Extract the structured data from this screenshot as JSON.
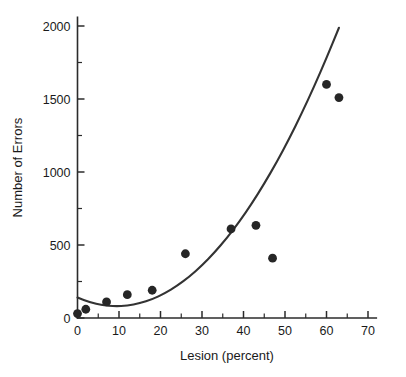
{
  "chart_data": {
    "type": "scatter",
    "title": "",
    "xlabel": "Lesion (percent)",
    "ylabel": "Number of Errors",
    "xlim": [
      0,
      72
    ],
    "ylim": [
      0,
      2060
    ],
    "grid": false,
    "legend": "none",
    "x_ticks": [
      0,
      10,
      20,
      30,
      40,
      50,
      60,
      70
    ],
    "x_tick_labels": [
      "0",
      "10",
      "20",
      "30",
      "40",
      "50",
      "60",
      "70"
    ],
    "x_minor_ticks": [
      5,
      15,
      25,
      35,
      45,
      55,
      65
    ],
    "y_ticks": [
      0,
      500,
      1000,
      1500,
      2000
    ],
    "y_tick_labels": [
      "0",
      "500",
      "1000",
      "1500",
      "2000"
    ],
    "y_minor_ticks": [
      250,
      750,
      1250,
      1750
    ],
    "marker_color": "#262626",
    "curve_color": "#333333",
    "axis_color": "#2b2b2b",
    "points": [
      {
        "x": 0,
        "y": 30
      },
      {
        "x": 2,
        "y": 60
      },
      {
        "x": 7,
        "y": 110
      },
      {
        "x": 12,
        "y": 160
      },
      {
        "x": 18,
        "y": 190
      },
      {
        "x": 26,
        "y": 440
      },
      {
        "x": 37,
        "y": 610
      },
      {
        "x": 43,
        "y": 635
      },
      {
        "x": 47,
        "y": 410
      },
      {
        "x": 60,
        "y": 1600
      },
      {
        "x": 63,
        "y": 1510
      }
    ],
    "fit": {
      "kind": "quadratic",
      "label": "fitted curve",
      "x_start": 0,
      "x_end": 69,
      "samples": [
        {
          "x": 0,
          "y": 140
        },
        {
          "x": 3,
          "y": 108
        },
        {
          "x": 6,
          "y": 88
        },
        {
          "x": 9,
          "y": 80
        },
        {
          "x": 12,
          "y": 84
        },
        {
          "x": 15,
          "y": 100
        },
        {
          "x": 18,
          "y": 128
        },
        {
          "x": 21,
          "y": 168
        },
        {
          "x": 24,
          "y": 220
        },
        {
          "x": 27,
          "y": 284
        },
        {
          "x": 30,
          "y": 360
        },
        {
          "x": 33,
          "y": 448
        },
        {
          "x": 36,
          "y": 548
        },
        {
          "x": 39,
          "y": 660
        },
        {
          "x": 42,
          "y": 784
        },
        {
          "x": 45,
          "y": 920
        },
        {
          "x": 48,
          "y": 1068
        },
        {
          "x": 51,
          "y": 1228
        },
        {
          "x": 54,
          "y": 1400
        },
        {
          "x": 57,
          "y": 1584
        },
        {
          "x": 60,
          "y": 1780
        },
        {
          "x": 63,
          "y": 1988
        },
        {
          "x": 66,
          "y": 2208
        },
        {
          "x": 69,
          "y": 2440
        }
      ]
    }
  }
}
